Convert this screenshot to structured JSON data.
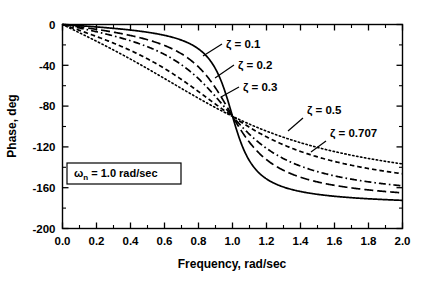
{
  "chart_data": {
    "type": "line",
    "title": "",
    "xlabel": "Frequency, rad/sec",
    "ylabel": "Phase, deg",
    "xlim": [
      0.0,
      2.0
    ],
    "ylim": [
      -200,
      0
    ],
    "xticks": [
      "0.0",
      "0.2",
      "0.4",
      "0.6",
      "0.8",
      "1.0",
      "1.2",
      "1.4",
      "1.6",
      "1.8",
      "2.0"
    ],
    "xtick_values": [
      0.0,
      0.2,
      0.4,
      0.6,
      0.8,
      1.0,
      1.2,
      1.4,
      1.6,
      1.8,
      2.0
    ],
    "yticks": [
      "0",
      "-40",
      "-80",
      "-120",
      "-160",
      "-200"
    ],
    "ytick_values": [
      0,
      -40,
      -80,
      -120,
      -160,
      -200
    ],
    "grid": false,
    "legend_position": "inline-annotations",
    "x": [
      0.0,
      0.05,
      0.1,
      0.15,
      0.2,
      0.25,
      0.3,
      0.35,
      0.4,
      0.45,
      0.5,
      0.55,
      0.6,
      0.65,
      0.7,
      0.75,
      0.8,
      0.85,
      0.9,
      0.95,
      1.0,
      1.05,
      1.1,
      1.15,
      1.2,
      1.25,
      1.3,
      1.35,
      1.4,
      1.45,
      1.5,
      1.55,
      1.6,
      1.65,
      1.7,
      1.75,
      1.8,
      1.85,
      1.9,
      1.95,
      2.0
    ],
    "series": [
      {
        "name": "zeta = 0.1",
        "zeta": 0.1,
        "style": "solid",
        "values": [
          0,
          -0.6,
          -1.2,
          -1.7,
          -2.4,
          -3.1,
          -3.8,
          -4.6,
          -5.5,
          -6.5,
          -7.6,
          -8.9,
          -10.5,
          -12.4,
          -14.9,
          -18.2,
          -22.9,
          -30.1,
          -41.9,
          -62.6,
          -90,
          -116.0,
          -134.8,
          -146.3,
          -153.4,
          -158.2,
          -161.6,
          -164.1,
          -166.0,
          -167.5,
          -168.7,
          -169.7,
          -170.5,
          -171.2,
          -171.8,
          -172.4,
          -172.8,
          -173.2,
          -173.6,
          -173.9,
          -174.2
        ]
      },
      {
        "name": "zeta = 0.2",
        "zeta": 0.2,
        "style": "long-dash",
        "values": [
          0,
          -1.1,
          -2.3,
          -3.5,
          -4.8,
          -6.1,
          -7.5,
          -9.1,
          -10.9,
          -12.9,
          -15.2,
          -17.9,
          -21.1,
          -24.9,
          -29.7,
          -35.8,
          -43.6,
          -53.8,
          -66.8,
          -82.2,
          -90,
          -118.0,
          -132.6,
          -142.3,
          -148.7,
          -153.2,
          -156.4,
          -158.9,
          -160.8,
          -162.4,
          -163.7,
          -164.7,
          -165.6,
          -166.4,
          -167.1,
          -167.7,
          -168.2,
          -168.6,
          -169.0,
          -169.4,
          -169.7
        ]
      },
      {
        "name": "zeta = 0.3",
        "zeta": 0.3,
        "style": "dash-dot",
        "values": [
          0,
          -1.7,
          -3.4,
          -5.2,
          -7.1,
          -9.2,
          -11.3,
          -13.7,
          -16.3,
          -19.3,
          -22.6,
          -26.4,
          -30.9,
          -36.0,
          -42.0,
          -49.1,
          -57.4,
          -66.8,
          -77.3,
          -88.4,
          -90,
          -111.0,
          -121.3,
          -130.0,
          -137.0,
          -142.5,
          -146.9,
          -150.4,
          -153.2,
          -155.5,
          -157.4,
          -159.0,
          -160.4,
          -161.6,
          -162.6,
          -163.5,
          -164.2,
          -164.9,
          -165.5,
          -166.1,
          -166.6
        ]
      },
      {
        "name": "zeta = 0.5",
        "zeta": 0.5,
        "style": "med-dash",
        "values": [
          0,
          -2.9,
          -5.8,
          -8.6,
          -11.8,
          -15.2,
          -18.8,
          -22.6,
          -26.8,
          -31.4,
          -36.4,
          -41.8,
          -47.7,
          -54.1,
          -60.9,
          -68.2,
          -75.8,
          -83.4,
          -90.9,
          -97.9,
          -90,
          -110.1,
          -115.6,
          -120.4,
          -124.6,
          -128.4,
          -131.7,
          -134.6,
          -137.2,
          -139.5,
          -141.6,
          -143.5,
          -145.2,
          -146.8,
          -148.2,
          -149.5,
          -150.7,
          -151.8,
          -152.8,
          -153.7,
          -154.6
        ]
      },
      {
        "name": "zeta = 0.707",
        "zeta": 0.707,
        "style": "dotted",
        "values": [
          0,
          -4.1,
          -8.1,
          -12.2,
          -16.5,
          -21.0,
          -25.8,
          -30.8,
          -36.1,
          -41.6,
          -47.4,
          -53.4,
          -59.5,
          -65.6,
          -71.7,
          -77.6,
          -83.3,
          -88.7,
          -93.8,
          -98.6,
          -90,
          -107.1,
          -110.9,
          -114.3,
          -117.6,
          -120.5,
          -123.3,
          -125.8,
          -128.1,
          -130.3,
          -132.2,
          -134.1,
          -135.8,
          -137.3,
          -138.8,
          -140.2,
          -141.4,
          -142.6,
          -143.7,
          -144.7,
          -145.7
        ]
      }
    ],
    "annotations": [
      {
        "id": "zeta-01",
        "text": "ζ = 0.1",
        "symbol": "ζ",
        "value": "0.1"
      },
      {
        "id": "zeta-02",
        "text": "ζ = 0.2",
        "symbol": "ζ",
        "value": "0.2"
      },
      {
        "id": "zeta-03",
        "text": "ζ = 0.3",
        "symbol": "ζ",
        "value": "0.3"
      },
      {
        "id": "zeta-05",
        "text": "ζ = 0.5",
        "symbol": "ζ",
        "value": "0.5"
      },
      {
        "id": "zeta-0707",
        "text": "ζ = 0.707",
        "symbol": "ζ",
        "value": "0.707"
      }
    ],
    "boxed_note": {
      "symbol": "ω",
      "subscript": "n",
      "rest": " = 1.0 rad/sec",
      "text": "ωn = 1.0 rad/sec"
    },
    "colors": {
      "line": "#000000",
      "axis": "#000000",
      "background": "#ffffff"
    }
  }
}
